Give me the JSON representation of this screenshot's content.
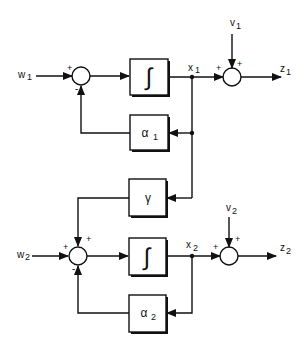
{
  "diagram": {
    "type": "block-diagram",
    "inputs": {
      "w1": "w",
      "w1_sub": "1",
      "w2": "w",
      "w2_sub": "2",
      "v1": "v",
      "v1_sub": "1",
      "v2": "v",
      "v2_sub": "2"
    },
    "outputs": {
      "z1": "z",
      "z1_sub": "1",
      "z2": "z",
      "z2_sub": "2"
    },
    "states": {
      "x1": "x",
      "x1_sub": "1",
      "x2": "x",
      "x2_sub": "2"
    },
    "blocks": {
      "integrator1": "∫",
      "alpha1": "α",
      "alpha1_sub": "1",
      "gamma": "γ",
      "integrator2": "∫",
      "alpha2": "α",
      "alpha2_sub": "2"
    },
    "signs": {
      "sum1_w": "+",
      "sum1_fb": "-",
      "out1_x": "+",
      "out1_v": "+",
      "sum2_w": "+",
      "sum2_gamma": "+",
      "sum2_fb": "-",
      "out2_x": "+",
      "out2_v": "+"
    },
    "colors": {
      "line": "#111111",
      "background": "#ffffff"
    }
  }
}
